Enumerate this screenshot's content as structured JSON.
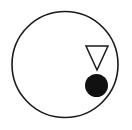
{
  "canvas": {
    "width": 132,
    "height": 130,
    "background_color": "#ffffff",
    "title": "Geometric figure: circle containing triangle and dot"
  },
  "palette": {
    "stroke_color": "#1a1a1a",
    "fill_black": "#111111",
    "fill_white": "#ffffff"
  },
  "chart_data": {
    "type": "scatter",
    "xlabel": "",
    "ylabel": "",
    "xlim": [
      0,
      132
    ],
    "ylim": [
      0,
      130
    ],
    "grid": false,
    "legend": null,
    "shapes": [
      {
        "name": "outer-circle",
        "kind": "circle",
        "style": "outline",
        "cx": 65,
        "cy": 64.5,
        "r": 53,
        "stroke": "#1a1a1a",
        "stroke_width": 1.6,
        "fill": "none"
      },
      {
        "name": "down-triangle",
        "kind": "triangle",
        "style": "outline",
        "orientation": "down",
        "cx": 96.5,
        "cy": 54.5,
        "width": 22,
        "height": 24,
        "points": "86,46 108,46 97,70",
        "stroke": "#1a1a1a",
        "stroke_width": 1.5,
        "fill": "none"
      },
      {
        "name": "filled-dot",
        "kind": "circle",
        "style": "solid",
        "cx": 96.5,
        "cy": 85.5,
        "r": 11.5,
        "stroke": "none",
        "stroke_width": 0,
        "fill": "#111111"
      }
    ]
  }
}
